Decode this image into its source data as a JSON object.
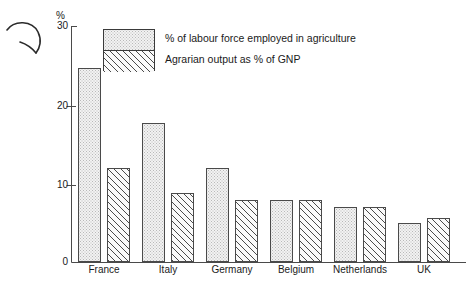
{
  "chart_data": {
    "type": "bar",
    "title": "",
    "subtitle": "",
    "xlabel": "",
    "ylabel": "%",
    "ylim": [
      0,
      30
    ],
    "yticks": [
      0,
      10,
      20,
      30
    ],
    "grid": false,
    "legend_position": "top-center",
    "categories": [
      "France",
      "Italy",
      "Germany",
      "Belgium",
      "Netherlands",
      "UK"
    ],
    "series": [
      {
        "name": "% of labour force employed in agriculture",
        "fill": "dotted",
        "values": [
          24.7,
          17.7,
          12.0,
          8.0,
          7.0,
          5.0
        ]
      },
      {
        "name": "Agrarian output as % of GNP",
        "fill": "diagonal-hatch",
        "values": [
          12.0,
          8.8,
          8.0,
          8.0,
          7.0,
          5.7
        ]
      }
    ]
  },
  "axis": {
    "unit_label": "%",
    "tick_labels": [
      "30",
      "20",
      "10",
      "0"
    ]
  },
  "legend": {
    "entries": [
      "% of labour force employed in agriculture",
      "Agrarian output as % of GNP"
    ]
  },
  "annotation": {
    "doodle_name": "hand-drawn-arc-mark"
  },
  "colors": {
    "axis": "#4a4a4a",
    "bar_outline": "#4a4a4a",
    "series1_fill": "#f2f2f2",
    "series2_hatch": "#4a4a4a",
    "text": "#1a1a1a",
    "background": "#ffffff"
  }
}
